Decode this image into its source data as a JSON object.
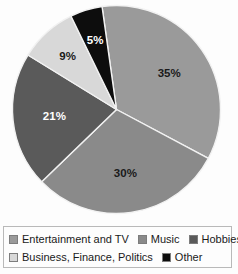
{
  "chart_data": {
    "type": "pie",
    "title": "",
    "subtitle": "",
    "xlabel": "",
    "ylabel": "",
    "grid": false,
    "legend_position": "bottom",
    "start_angle_deg": -8,
    "direction": "clockwise",
    "categories": [
      "Entertainment and TV",
      "Music",
      "Hobbies",
      "Business, Finance, Politics",
      "Other"
    ],
    "values": [
      35,
      30,
      21,
      9,
      5
    ],
    "unit": "%",
    "data_labels": [
      "35%",
      "30%",
      "21%",
      "9%",
      "5%"
    ],
    "slices": [
      {
        "label": "Entertainment and TV",
        "value": 35,
        "data_label": "35%",
        "color": "#9a9a9a",
        "label_color": "dark"
      },
      {
        "label": "Music",
        "value": 30,
        "data_label": "30%",
        "color": "#8a8a8a",
        "label_color": "dark"
      },
      {
        "label": "Hobbies",
        "value": 21,
        "data_label": "21%",
        "color": "#5a5a5a",
        "label_color": "light"
      },
      {
        "label": "Business, Finance, Politics",
        "value": 9,
        "data_label": "9%",
        "color": "#d8d8d8",
        "label_color": "dark"
      },
      {
        "label": "Other",
        "value": 5,
        "data_label": "5%",
        "color": "#0d0d0d",
        "label_color": "light"
      }
    ]
  },
  "legend": {
    "rows": [
      [
        {
          "label": "Entertainment and TV",
          "color": "#9a9a9a"
        },
        {
          "label": "Music",
          "color": "#8a8a8a"
        },
        {
          "label": "Hobbies",
          "color": "#5a5a5a"
        }
      ],
      [
        {
          "label": "Business, Finance, Politics",
          "color": "#d8d8d8"
        },
        {
          "label": "Other",
          "color": "#0d0d0d"
        }
      ]
    ]
  },
  "colors": {
    "background": "#fdfdfd",
    "legend_border": "#b9b9b9",
    "slice_outline": "#f2f2f2",
    "text": "#1a1a1a"
  }
}
